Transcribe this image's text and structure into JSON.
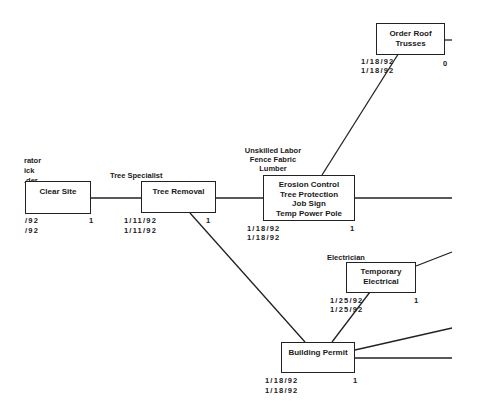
{
  "nodes": {
    "clear_site": {
      "title": "Clear Site",
      "resources": [
        "rator",
        "ick",
        ".der"
      ],
      "start": "/92",
      "finish": "/92",
      "duration": "1"
    },
    "tree_removal": {
      "title": "Tree Removal",
      "resources": [
        "Tree Specialist"
      ],
      "start": "1/11/92",
      "finish": "1/11/92",
      "duration": "1"
    },
    "erosion_control": {
      "title_lines": [
        "Erosion Control",
        "Tree Protection",
        "Job Sign",
        "Temp Power Pole"
      ],
      "resources": [
        "Unskilled Labor",
        "Fence Fabric",
        "Lumber"
      ],
      "start": "1/18/92",
      "finish": "1/18/92",
      "duration": "1"
    },
    "order_roof_trusses": {
      "title_lines": [
        "Order Roof",
        "Trusses"
      ],
      "start": "1/18/92",
      "finish": "1/18/92",
      "duration": "0"
    },
    "temporary_electrical": {
      "title_lines": [
        "Temporary",
        "Electrical"
      ],
      "resources": [
        "Electrician"
      ],
      "start": "1/25/92",
      "finish": "1/25/92",
      "duration": "1"
    },
    "building_permit": {
      "title": "Building Permit",
      "start": "1/18/92",
      "finish": "1/18/92",
      "duration": "1"
    }
  },
  "colors": {
    "line": "#222222",
    "background": "#ffffff",
    "text": "#1a1a1a"
  }
}
